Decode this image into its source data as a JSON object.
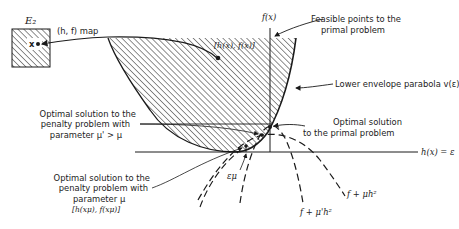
{
  "diagram": {
    "type": "penalty-function geometric interpretation",
    "domain_box": {
      "label": "E₂",
      "point_label": "x"
    },
    "map_label": "(h, f) map",
    "image_point_label": "[h(x), f(x)]",
    "axis_vertical_label": "f(x)",
    "axis_horizontal_label": "h(x) = ε",
    "annotations": {
      "feasible": [
        "Feasible points to the",
        "primal problem"
      ],
      "lower_envelope": "Lower envelope parabola v(ε)",
      "primal_optimum": [
        "Optimal solution",
        "to the primal problem"
      ],
      "penalty_mu_prime": [
        "Optimal solution to the",
        "penalty problem with",
        "parameter μ' > μ"
      ],
      "penalty_mu": [
        "Optimal solution to the",
        "penalty problem with",
        "parameter μ",
        "[h(xμ), f(xμ)]"
      ],
      "epsilon_mu": "εμ",
      "curve_mu": "f + μh²",
      "curve_mu_prime": "f + μ'h²"
    },
    "colors": {
      "ink": "#1a1a1a",
      "background": "#ffffff"
    }
  }
}
